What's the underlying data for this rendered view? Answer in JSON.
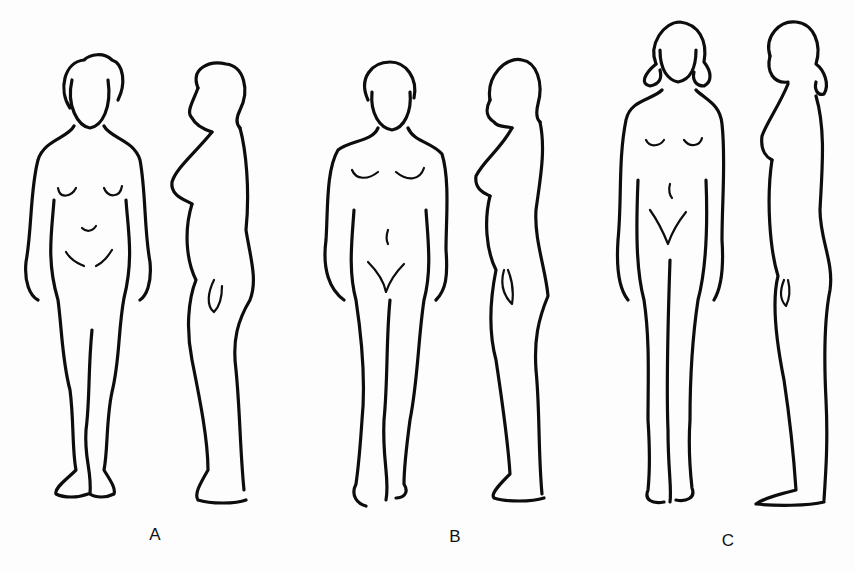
{
  "diagram": {
    "title": "",
    "groups": [
      {
        "label": "A",
        "views": [
          "front",
          "side"
        ],
        "label_pos": [
          155,
          535
        ]
      },
      {
        "label": "B",
        "views": [
          "front",
          "side"
        ],
        "label_pos": [
          455,
          537
        ]
      },
      {
        "label": "C",
        "views": [
          "front",
          "side"
        ],
        "label_pos": [
          728,
          541
        ]
      }
    ],
    "stroke_color": "#0d0d0d",
    "background": "#fdfdfd"
  }
}
